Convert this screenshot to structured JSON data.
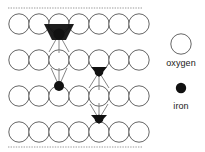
{
  "figure": {
    "background_color": "#ffffff",
    "width": 205,
    "height": 152
  },
  "colors": {
    "oxygen_fill": "#ffffff",
    "oxygen_stroke": "#555555",
    "iron_fill": "#111111",
    "bond_stroke": "#777777",
    "boundary_stroke": "#999999",
    "text": "#1a1a1a"
  },
  "diagram": {
    "boundaries": [
      {
        "name": "top-boundary",
        "x1": 8,
        "y1": 8,
        "x2": 143,
        "y2": 8,
        "style": "dashed"
      },
      {
        "name": "bottom-boundary",
        "x1": 8,
        "y1": 147,
        "x2": 143,
        "y2": 147,
        "style": "dashed"
      }
    ],
    "oxygen_radius": 10.2,
    "oxygen_rows": [
      {
        "row": 1,
        "cy": 24,
        "cxs": [
          19,
          39,
          59,
          79,
          99,
          119,
          139
        ]
      },
      {
        "row": 2,
        "cy": 60,
        "cxs": [
          19,
          39,
          59,
          79,
          99,
          119,
          139
        ]
      },
      {
        "row": 3,
        "cy": 96,
        "cxs": [
          19,
          39,
          59,
          79,
          99,
          119,
          139
        ]
      },
      {
        "row": 4,
        "cy": 132,
        "cxs": [
          19,
          39,
          59,
          79,
          99,
          119,
          139
        ]
      }
    ],
    "iron_atoms": [
      {
        "id": "iron-1",
        "cx": 59,
        "cy": 34,
        "r": 5.2
      },
      {
        "id": "iron-2",
        "cx": 59,
        "cy": 86,
        "r": 5.0
      },
      {
        "id": "iron-3",
        "cx": 99,
        "cy": 72,
        "r": 4.4
      },
      {
        "id": "iron-4",
        "cx": 99,
        "cy": 119,
        "r": 4.4
      }
    ],
    "bonds": [
      {
        "from": "iron-1",
        "x1": 59,
        "y1": 34,
        "x2": 45,
        "y2": 25
      },
      {
        "from": "iron-1",
        "x1": 59,
        "y1": 34,
        "x2": 73,
        "y2": 25
      },
      {
        "from": "iron-1",
        "x1": 59,
        "y1": 34,
        "x2": 49,
        "y2": 52
      },
      {
        "from": "iron-1",
        "x1": 59,
        "y1": 34,
        "x2": 69,
        "y2": 52
      },
      {
        "from": "iron-1",
        "x1": 59,
        "y1": 34,
        "x2": 59,
        "y2": 53
      },
      {
        "from": "iron-2",
        "x1": 59,
        "y1": 86,
        "x2": 51,
        "y2": 68
      },
      {
        "from": "iron-2",
        "x1": 59,
        "y1": 86,
        "x2": 67,
        "y2": 68
      },
      {
        "from": "iron-2",
        "x1": 59,
        "y1": 86,
        "x2": 59,
        "y2": 68
      },
      {
        "from": "iron-3",
        "x1": 99,
        "y1": 72,
        "x2": 89,
        "y2": 88
      },
      {
        "from": "iron-3",
        "x1": 99,
        "y1": 72,
        "x2": 109,
        "y2": 88
      },
      {
        "from": "iron-3",
        "x1": 99,
        "y1": 72,
        "x2": 99,
        "y2": 90
      },
      {
        "from": "iron-4",
        "x1": 99,
        "y1": 119,
        "x2": 90,
        "y2": 104
      },
      {
        "from": "iron-4",
        "x1": 99,
        "y1": 119,
        "x2": 108,
        "y2": 104
      },
      {
        "from": "iron-4",
        "x1": 99,
        "y1": 119,
        "x2": 99,
        "y2": 103
      }
    ]
  },
  "legend": {
    "items": [
      {
        "key": "oxygen",
        "label": "oxygen",
        "marker": "open-circle",
        "cx": 181,
        "cy": 44,
        "r": 10.2
      },
      {
        "key": "iron",
        "label": "iron",
        "marker": "filled-circle",
        "cx": 181,
        "cy": 88,
        "r": 5.2
      }
    ]
  }
}
